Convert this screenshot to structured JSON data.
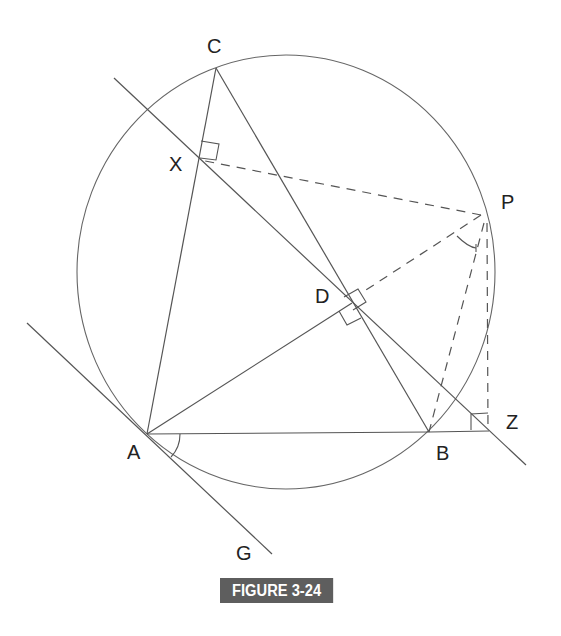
{
  "figure": {
    "caption": "FIGURE 3-24",
    "caption_bg": "#5e5e5e",
    "line_color": "#555555"
  },
  "points": {
    "A": {
      "label": "A",
      "x": 147,
      "y": 434
    },
    "B": {
      "label": "B",
      "x": 429,
      "y": 432
    },
    "C": {
      "label": "C",
      "x": 216,
      "y": 68
    },
    "P": {
      "label": "P",
      "x": 481,
      "y": 215
    },
    "X": {
      "label": "X",
      "x": 199,
      "y": 160
    },
    "D": {
      "label": "D",
      "x": 352,
      "y": 303
    },
    "Z": {
      "label": "Z",
      "x": 488,
      "y": 430
    },
    "G": {
      "label": "G",
      "x": 273,
      "y": 553
    }
  },
  "circle": {
    "cx": 286,
    "cy": 272,
    "r": 214
  },
  "labels": {
    "C": "C",
    "X": "X",
    "P": "P",
    "D": "D",
    "A": "A",
    "B": "B",
    "Z": "Z",
    "G": "G"
  },
  "segments": {
    "solid": [
      "AB",
      "BC",
      "CA",
      "AD",
      "tangent-AG",
      "Simson-line-XZ",
      "BZ"
    ],
    "dashed": [
      "PX",
      "PD",
      "PB",
      "PZ"
    ]
  },
  "right_angle_marks": [
    "X",
    "D (on PD)",
    "D (on AD)",
    "Z"
  ],
  "angle_marks": [
    "angle at A between AB and AG",
    "angle at P between PD and PB"
  ]
}
